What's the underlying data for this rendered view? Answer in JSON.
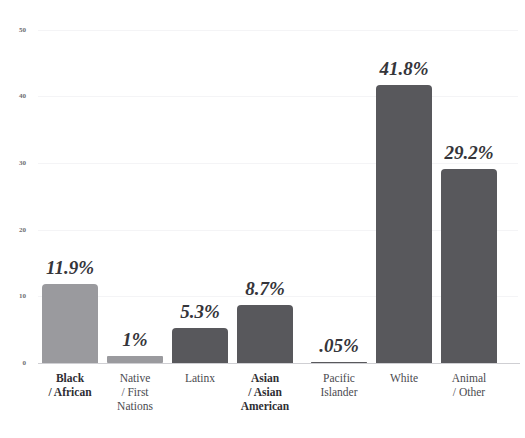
{
  "chart_data": {
    "type": "bar",
    "title": "",
    "xlabel": "",
    "ylabel": "",
    "ylim": [
      0,
      50
    ],
    "yticks": [
      "0",
      "10",
      "20",
      "30",
      "40",
      "50"
    ],
    "grid": true,
    "legend": "none",
    "categories": [
      "Black / African",
      "Native / First Nations",
      "Latinx",
      "Asian / Asian American",
      "Pacific Islander",
      "White",
      "Animal / Other"
    ],
    "category_lines": [
      [
        "Black",
        "/ African"
      ],
      [
        "Native",
        "/ First",
        "Nations"
      ],
      [
        "Latinx"
      ],
      [
        "Asian",
        "/ Asian",
        "American"
      ],
      [
        "Pacific",
        "Islander"
      ],
      [
        "White"
      ],
      [
        "Animal",
        "/ Other"
      ]
    ],
    "values": [
      11.9,
      1,
      5.3,
      8.7,
      0.05,
      41.8,
      29.2
    ],
    "value_labels": [
      "11.9%",
      "1%",
      "5.3%",
      "8.7%",
      ".05%",
      "41.8%",
      "29.2%"
    ],
    "bar_colors": [
      "#9a9a9e",
      "#9a9a9e",
      "#58585c",
      "#58585c",
      "#58585c",
      "#58585c",
      "#58585c"
    ],
    "emphasized_categories": [
      true,
      true,
      false,
      true,
      false,
      false,
      false
    ]
  },
  "axis": {
    "tick_0": "0",
    "tick_10": "10",
    "tick_20": "20",
    "tick_30": "30",
    "tick_40": "40",
    "tick_50": "50"
  },
  "colors": {
    "background": "#ffffff",
    "bar_light": "#9a9a9e",
    "bar_dark": "#58585c",
    "gridline": "#f4f4f6",
    "axis": "#cfcfd3",
    "value_text": "#35353a",
    "tick_text": "#6d6d72"
  }
}
